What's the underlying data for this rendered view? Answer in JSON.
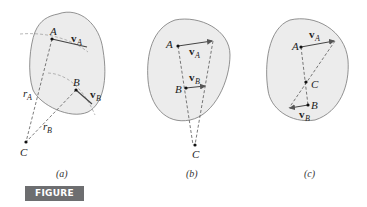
{
  "figure": {
    "label": "FIGURE 5/7",
    "label_bg_color": "#6d6e70",
    "body_fill_color": "#ececec",
    "panels": [
      {
        "caption": "(a)",
        "points": [
          "A",
          "B",
          "C"
        ],
        "vectors": [
          {
            "name": "v",
            "sub": "A"
          },
          {
            "name": "v",
            "sub": "B"
          }
        ],
        "radii": [
          {
            "name": "r",
            "sub": "A"
          },
          {
            "name": "r",
            "sub": "B"
          }
        ]
      },
      {
        "caption": "(b)",
        "points": [
          "A",
          "B",
          "C"
        ],
        "vectors": [
          {
            "name": "v",
            "sub": "A"
          },
          {
            "name": "v",
            "sub": "B"
          }
        ]
      },
      {
        "caption": "(c)",
        "points": [
          "A",
          "C",
          "B"
        ],
        "vectors": [
          {
            "name": "v",
            "sub": "A"
          },
          {
            "name": "v",
            "sub": "B"
          }
        ]
      }
    ]
  }
}
